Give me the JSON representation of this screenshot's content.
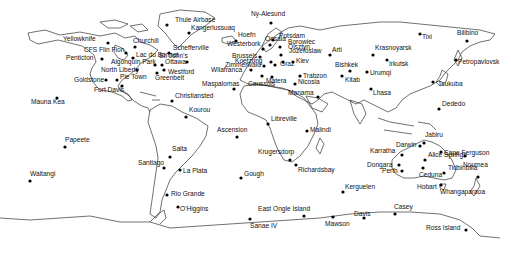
{
  "map": {
    "title": "",
    "marker_color": "#000000",
    "coastline_color": "#333333",
    "background_color": "#ffffff",
    "stations": [
      {
        "name": "Thule Airbase",
        "region": "Greenland"
      },
      {
        "name": "Ny-Alesund",
        "region": "Svalbard"
      },
      {
        "name": "Kangerlussuaq",
        "region": "Greenland"
      },
      {
        "name": "Hoefn",
        "region": "Iceland"
      },
      {
        "name": "Yellowknife",
        "region": "North America"
      },
      {
        "name": "Churchill",
        "region": "North America"
      },
      {
        "name": "Schefferville",
        "region": "North America"
      },
      {
        "name": "CFS Flin Flon",
        "region": "North America"
      },
      {
        "name": "Lac du Bonnet",
        "region": "North America"
      },
      {
        "name": "St. John's",
        "region": "North America"
      },
      {
        "name": "Penticton",
        "region": "North America"
      },
      {
        "name": "Algonquin Park",
        "region": "North America"
      },
      {
        "name": "Ottawa",
        "region": "North America"
      },
      {
        "name": "North Liberty",
        "region": "North America"
      },
      {
        "name": "Westford",
        "region": "North America"
      },
      {
        "name": "Goldstone",
        "region": "North America"
      },
      {
        "name": "Pie Town",
        "region": "North America"
      },
      {
        "name": "Greenbelt",
        "region": "North America"
      },
      {
        "name": "Fort Davis",
        "region": "North America"
      },
      {
        "name": "Mauna Kea",
        "region": "Pacific"
      },
      {
        "name": "Christiansted",
        "region": "Caribbean"
      },
      {
        "name": "Kourou",
        "region": "South America"
      },
      {
        "name": "Papeete",
        "region": "Pacific"
      },
      {
        "name": "Salta",
        "region": "South America"
      },
      {
        "name": "Santiago",
        "region": "South America"
      },
      {
        "name": "La Plata",
        "region": "South America"
      },
      {
        "name": "Waitangi",
        "region": "Pacific"
      },
      {
        "name": "Rio Grande",
        "region": "South America"
      },
      {
        "name": "O'Higgins",
        "region": "Antarctica"
      },
      {
        "name": "Westerbork",
        "region": "Europe"
      },
      {
        "name": "Onsala",
        "region": "Europe"
      },
      {
        "name": "Potsdam",
        "region": "Europe"
      },
      {
        "name": "Borowiec",
        "region": "Europe"
      },
      {
        "name": "Olsztyn",
        "region": "Europe"
      },
      {
        "name": "Jozefoslaw",
        "region": "Europe"
      },
      {
        "name": "Brussels",
        "region": "Europe"
      },
      {
        "name": "Koetzting",
        "region": "Europe"
      },
      {
        "name": "Zimmerwald",
        "region": "Europe"
      },
      {
        "name": "Wilafranca",
        "region": "Europe"
      },
      {
        "name": "Graz",
        "region": "Europe"
      },
      {
        "name": "Kiev",
        "region": "Europe"
      },
      {
        "name": "Matera",
        "region": "Europe"
      },
      {
        "name": "Caussols",
        "region": "Europe"
      },
      {
        "name": "Maspalomas",
        "region": "Africa"
      },
      {
        "name": "Trabzon",
        "region": "Asia"
      },
      {
        "name": "Nicosia",
        "region": "Asia"
      },
      {
        "name": "Manama",
        "region": "Asia"
      },
      {
        "name": "Arti",
        "region": "Asia"
      },
      {
        "name": "Bishkek",
        "region": "Asia"
      },
      {
        "name": "Kitab",
        "region": "Asia"
      },
      {
        "name": "Krasnoyarsk",
        "region": "Asia"
      },
      {
        "name": "Irkutsk",
        "region": "Asia"
      },
      {
        "name": "Urumqi",
        "region": "Asia"
      },
      {
        "name": "Lhasa",
        "region": "Asia"
      },
      {
        "name": "Tixi",
        "region": "Asia"
      },
      {
        "name": "Bilibino",
        "region": "Asia"
      },
      {
        "name": "Petropavlovsk",
        "region": "Asia"
      },
      {
        "name": "Tsukuba",
        "region": "Asia"
      },
      {
        "name": "Dededo",
        "region": "Pacific"
      },
      {
        "name": "Libreville",
        "region": "Africa"
      },
      {
        "name": "Ascension",
        "region": "Atlantic"
      },
      {
        "name": "Malindi",
        "region": "Africa"
      },
      {
        "name": "Krugersdorp",
        "region": "Africa"
      },
      {
        "name": "Richardsbay",
        "region": "Africa"
      },
      {
        "name": "Gough",
        "region": "Atlantic"
      },
      {
        "name": "Kerguelen",
        "region": "Indian Ocean"
      },
      {
        "name": "Darwin",
        "region": "Australia"
      },
      {
        "name": "Jabiru",
        "region": "Australia"
      },
      {
        "name": "Karratha",
        "region": "Australia"
      },
      {
        "name": "Cape Ferguson",
        "region": "Australia"
      },
      {
        "name": "Alice Springs",
        "region": "Australia"
      },
      {
        "name": "Dongara",
        "region": "Australia"
      },
      {
        "name": "Perth",
        "region": "Australia"
      },
      {
        "name": "Ceduna",
        "region": "Australia"
      },
      {
        "name": "Tidbinbilla",
        "region": "Australia"
      },
      {
        "name": "Noumea",
        "region": "Pacific"
      },
      {
        "name": "Hobart",
        "region": "Australia"
      },
      {
        "name": "Whangaparaoa",
        "region": "New Zealand"
      },
      {
        "name": "East Ongle Island",
        "region": "Antarctica"
      },
      {
        "name": "Syowa",
        "region": "Antarctica"
      },
      {
        "name": "Sanae IV",
        "region": "Antarctica"
      },
      {
        "name": "Mawson",
        "region": "Antarctica"
      },
      {
        "name": "Davis",
        "region": "Antarctica"
      },
      {
        "name": "Casey",
        "region": "Antarctica"
      },
      {
        "name": "Ross Island",
        "region": "Antarctica"
      }
    ]
  }
}
